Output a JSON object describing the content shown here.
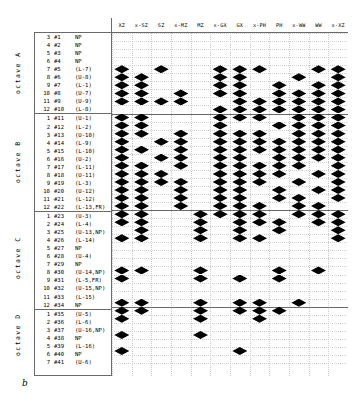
{
  "figure": {
    "caption": "b"
  },
  "columns": [
    "XZ",
    "x-SZ",
    "SZ",
    "x-MZ",
    "MZ",
    "x-GX",
    "GX",
    "x-PH",
    "PH",
    "x-WW",
    "WW",
    "x-XZ"
  ],
  "octaves": [
    {
      "name": "octave A",
      "rows": [
        {
          "oct": "3",
          "idx": "#1",
          "tag": "NP"
        },
        {
          "oct": "4",
          "idx": "#2",
          "tag": "NP"
        },
        {
          "oct": "5",
          "idx": "#3",
          "tag": "NP"
        },
        {
          "oct": "6",
          "idx": "#4",
          "tag": "NP"
        },
        {
          "oct": "7",
          "idx": "#5",
          "tag": "(L-7)"
        },
        {
          "oct": "8",
          "idx": "#6",
          "tag": "(U-8)"
        },
        {
          "oct": "9",
          "idx": "#7",
          "tag": "(L-1)"
        },
        {
          "oct": "10",
          "idx": "#8",
          "tag": "(U-7)"
        },
        {
          "oct": "11",
          "idx": "#9",
          "tag": "(U-9)"
        },
        {
          "oct": "12",
          "idx": "#10",
          "tag": "(L-8)"
        }
      ]
    },
    {
      "name": "octave B",
      "rows": [
        {
          "oct": "1",
          "idx": "#11",
          "tag": "(U-1)"
        },
        {
          "oct": "2",
          "idx": "#12",
          "tag": "(L-2)"
        },
        {
          "oct": "3",
          "idx": "#13",
          "tag": "(U-10)"
        },
        {
          "oct": "4",
          "idx": "#14",
          "tag": "(L-9)"
        },
        {
          "oct": "5",
          "idx": "#15",
          "tag": "(L-10)"
        },
        {
          "oct": "6",
          "idx": "#16",
          "tag": "(U-2)"
        },
        {
          "oct": "7",
          "idx": "#17",
          "tag": "(L-11)"
        },
        {
          "oct": "8",
          "idx": "#18",
          "tag": "(U-11)"
        },
        {
          "oct": "9",
          "idx": "#19",
          "tag": "(L-3)"
        },
        {
          "oct": "10",
          "idx": "#20",
          "tag": "(U-12)"
        },
        {
          "oct": "11",
          "idx": "#21",
          "tag": "(L-12)"
        },
        {
          "oct": "12",
          "idx": "#22",
          "tag": "(L-13,FR)"
        }
      ]
    },
    {
      "name": "octave C",
      "rows": [
        {
          "oct": "1",
          "idx": "#23",
          "tag": "(U-3)"
        },
        {
          "oct": "2",
          "idx": "#24",
          "tag": "(L-4)"
        },
        {
          "oct": "3",
          "idx": "#25",
          "tag": "(U-13,NP)"
        },
        {
          "oct": "4",
          "idx": "#26",
          "tag": "(L-14)"
        },
        {
          "oct": "5",
          "idx": "#27",
          "tag": "NP"
        },
        {
          "oct": "6",
          "idx": "#28",
          "tag": "(U-4)"
        },
        {
          "oct": "7",
          "idx": "#29",
          "tag": "NP"
        },
        {
          "oct": "8",
          "idx": "#30",
          "tag": "(U-14,NP)"
        },
        {
          "oct": "9",
          "idx": "#31",
          "tag": "(L-5,FR)"
        },
        {
          "oct": "10",
          "idx": "#32",
          "tag": "(U-15,NP)"
        },
        {
          "oct": "11",
          "idx": "#33",
          "tag": "(L-15)"
        },
        {
          "oct": "12",
          "idx": "#34",
          "tag": "NP"
        }
      ]
    },
    {
      "name": "octave D",
      "rows": [
        {
          "oct": "1",
          "idx": "#35",
          "tag": "(U-5)"
        },
        {
          "oct": "2",
          "idx": "#36",
          "tag": "(L-6)"
        },
        {
          "oct": "3",
          "idx": "#37",
          "tag": "(U-16,NP)"
        },
        {
          "oct": "4",
          "idx": "#38",
          "tag": "NP"
        },
        {
          "oct": "5",
          "idx": "#39",
          "tag": "(L-16)"
        },
        {
          "oct": "6",
          "idx": "#40",
          "tag": "NP"
        },
        {
          "oct": "7",
          "idx": "#41",
          "tag": "(U-6)"
        }
      ]
    }
  ],
  "chart_data": {
    "type": "scatter",
    "title": "",
    "xlabel": "",
    "ylabel": "",
    "marker": "diamond",
    "marker_color": "#000000",
    "grid": true,
    "legend": "none",
    "x_categories": [
      "XZ",
      "x-SZ",
      "SZ",
      "x-MZ",
      "MZ",
      "x-GX",
      "GX",
      "x-PH",
      "PH",
      "x-WW",
      "WW",
      "x-XZ"
    ],
    "y_categories": [
      "A-3 #1 NP",
      "A-4 #2 NP",
      "A-5 #3 NP",
      "A-6 #4 NP",
      "A-7 #5 (L-7)",
      "A-8 #6 (U-8)",
      "A-9 #7 (L-1)",
      "A-10 #8 (U-7)",
      "A-11 #9 (U-9)",
      "A-12 #10 (L-8)",
      "B-1 #11 (U-1)",
      "B-2 #12 (L-2)",
      "B-3 #13 (U-10)",
      "B-4 #14 (L-9)",
      "B-5 #15 (L-10)",
      "B-6 #16 (U-2)",
      "B-7 #17 (L-11)",
      "B-8 #18 (U-11)",
      "B-9 #19 (L-3)",
      "B-10 #20 (U-12)",
      "B-11 #21 (L-12)",
      "B-12 #22 (L-13,FR)",
      "C-1 #23 (U-3)",
      "C-2 #24 (L-4)",
      "C-3 #25 (U-13,NP)",
      "C-4 #26 (L-14)",
      "C-5 #27 NP",
      "C-6 #28 (U-4)",
      "C-7 #29 NP",
      "C-8 #30 (U-14,NP)",
      "C-9 #31 (L-5,FR)",
      "C-10 #32 (U-15,NP)",
      "C-11 #33 (L-15)",
      "C-12 #34 NP",
      "D-1 #35 (U-5)",
      "D-2 #36 (L-6)",
      "D-3 #37 (U-16,NP)",
      "D-4 #38 NP",
      "D-5 #39 (L-16)",
      "D-6 #40 NP",
      "D-7 #41 (U-6)"
    ],
    "points": [
      {
        "row": 4,
        "cols": [
          0,
          2,
          5,
          6,
          7,
          10,
          11
        ]
      },
      {
        "row": 5,
        "cols": [
          0,
          1,
          5,
          6,
          9,
          11
        ]
      },
      {
        "row": 6,
        "cols": [
          0,
          1,
          5,
          6,
          8,
          10,
          11
        ]
      },
      {
        "row": 7,
        "cols": [
          0,
          1,
          3,
          5,
          6,
          8,
          9,
          10,
          11
        ]
      },
      {
        "row": 8,
        "cols": [
          0,
          1,
          2,
          3,
          6,
          7,
          8,
          9,
          10,
          11
        ]
      },
      {
        "row": 9,
        "cols": [
          5,
          6,
          7,
          8,
          9,
          10,
          11
        ]
      },
      {
        "row": 10,
        "cols": [
          0,
          1,
          5,
          6,
          7,
          9,
          10,
          11
        ]
      },
      {
        "row": 11,
        "cols": [
          0,
          1,
          5,
          8,
          9,
          10,
          11
        ]
      },
      {
        "row": 12,
        "cols": [
          0,
          1,
          3,
          5,
          6,
          7,
          9,
          10,
          11
        ]
      },
      {
        "row": 13,
        "cols": [
          0,
          2,
          3,
          5,
          6,
          7,
          8,
          9,
          10,
          11
        ]
      },
      {
        "row": 14,
        "cols": [
          0,
          1,
          3,
          5,
          6,
          7,
          8,
          9,
          10,
          11
        ]
      },
      {
        "row": 15,
        "cols": [
          0,
          2,
          3,
          5,
          6,
          8,
          9,
          10,
          11
        ]
      },
      {
        "row": 16,
        "cols": [
          0,
          1,
          3,
          5,
          6,
          7,
          8,
          9,
          11
        ]
      },
      {
        "row": 17,
        "cols": [
          0,
          1,
          2,
          5,
          6,
          7,
          8,
          10,
          11
        ]
      },
      {
        "row": 18,
        "cols": [
          0,
          1,
          2,
          3,
          5,
          6,
          7,
          9,
          11
        ]
      },
      {
        "row": 19,
        "cols": [
          0,
          1,
          3,
          5,
          6,
          8,
          10,
          11
        ]
      },
      {
        "row": 20,
        "cols": [
          0,
          1,
          3,
          5,
          6,
          8,
          9,
          11
        ]
      },
      {
        "row": 21,
        "cols": [
          0,
          1,
          3,
          5,
          6,
          7,
          9,
          10
        ]
      },
      {
        "row": 22,
        "cols": [
          0,
          1,
          4,
          5,
          6,
          7,
          9,
          10,
          11
        ]
      },
      {
        "row": 23,
        "cols": [
          0,
          1,
          4,
          6,
          7,
          8,
          10,
          11
        ]
      },
      {
        "row": 24,
        "cols": [
          1,
          4,
          6,
          8,
          11
        ]
      },
      {
        "row": 25,
        "cols": [
          0,
          1,
          4,
          6,
          7,
          11
        ]
      },
      {
        "row": 29,
        "cols": [
          0,
          1,
          4,
          8,
          10
        ]
      },
      {
        "row": 30,
        "cols": [
          0,
          4,
          6,
          8
        ]
      },
      {
        "row": 33,
        "cols": [
          0,
          1,
          4,
          6,
          7,
          9
        ]
      },
      {
        "row": 34,
        "cols": [
          0,
          1,
          4,
          6,
          7,
          8
        ]
      },
      {
        "row": 35,
        "cols": [
          0,
          4,
          7
        ]
      },
      {
        "row": 37,
        "cols": [
          0,
          4
        ]
      },
      {
        "row": 39,
        "cols": [
          0,
          6
        ]
      }
    ]
  }
}
